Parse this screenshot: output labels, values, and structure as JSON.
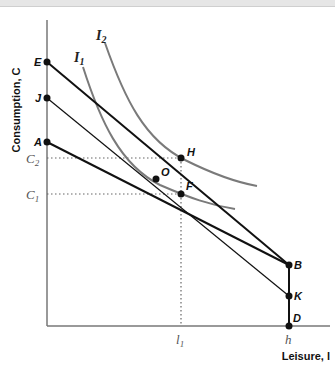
{
  "diagram": {
    "axes": {
      "y_label": "Consumption, C",
      "x_label": "Leisure, l"
    },
    "points": {
      "E": "E",
      "J": "J",
      "A": "A",
      "H": "H",
      "O": "O",
      "F": "F",
      "B": "B",
      "K": "K",
      "D": "D"
    },
    "value_labels": {
      "C2": "C",
      "C2_sub": "2",
      "C1": "C",
      "C1_sub": "1",
      "l1": "l",
      "l1_sub": "1",
      "h": "h"
    },
    "curves": {
      "I1": "I",
      "I1_sub": "1",
      "I2": "I",
      "I2_sub": "2"
    },
    "colors": {
      "budget_line": "#111111",
      "indifference_curve": "#7a7a7a",
      "axis": "#777777",
      "guide": "#666666"
    }
  }
}
